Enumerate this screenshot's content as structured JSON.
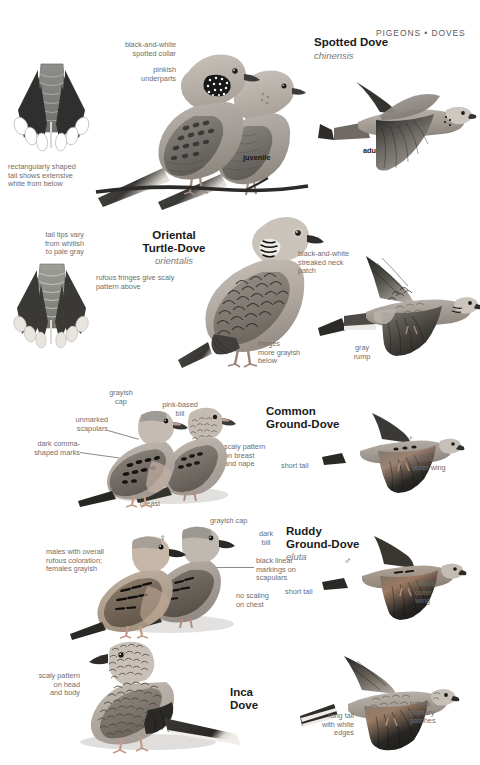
{
  "page": {
    "header": "PIGEONS • DOVES",
    "width": 480,
    "height": 765,
    "background": "#ffffff",
    "text_color": "#6e6e6e",
    "heading_color": "#1a1a1a"
  },
  "species": [
    {
      "id": "spotted-dove",
      "name": "Spotted Dove",
      "latin": "chinensis",
      "captions": [
        "black-and-white\nspotted collar",
        "pinkish\nunderparts",
        "rectangularly shaped\ntail shows extensive\nwhite from below"
      ],
      "labels": [
        "juvenile",
        "adult"
      ],
      "symbols": []
    },
    {
      "id": "oriental-turtle-dove",
      "name": "Oriental\nTurtle-Dove",
      "name_line1": "Oriental",
      "name_line2": "Turtle-Dove",
      "latin": "orientalis",
      "captions": [
        "tail tips vary\nfrom whitish\nto pale gray",
        "rufous fringes give scaly\npattern above",
        "black-and-white\nstreaked neck\npatch",
        "fringes\nmore grayish\nbelow",
        "gray\nrump"
      ],
      "labels": [],
      "symbols": []
    },
    {
      "id": "common-ground-dove",
      "name": "Common\nGround-Dove",
      "name_line1": "Common",
      "name_line2": "Ground-Dove",
      "latin": "",
      "captions": [
        "grayish\ncap",
        "pink-based\nbill",
        "unmarked\nscapulars",
        "dark comma-\nshaped marks",
        "scaly pattern\non breast\nand nape",
        "pinkish\nbreast",
        "short tail",
        "rufous\nouter wing"
      ],
      "labels": [],
      "symbols": [
        "♂",
        "♀",
        "♂"
      ]
    },
    {
      "id": "ruddy-ground-dove",
      "name": "Ruddy\nGround-Dove",
      "name_line1": "Ruddy",
      "name_line2": "Ground-Dove",
      "latin": "eluta",
      "captions": [
        "grayish cap",
        "dark\nbill",
        "males with overall\nrufous coloration;\nfemales grayish",
        "black linear\nmarkings on\nscapulars",
        "no scaling\non chest",
        "short tail",
        "rufous\nouter\nwing"
      ],
      "labels": [],
      "symbols": [
        "♀",
        "♂",
        "♂"
      ]
    },
    {
      "id": "inca-dove",
      "name": "Inca\nDove",
      "name_line1": "Inca",
      "name_line2": "Dove",
      "latin": "",
      "captions": [
        "scaly pattern\non head\nand body",
        "long tail\nwith white\nedges",
        "rufous\nprimary\npatches"
      ],
      "labels": [],
      "symbols": []
    }
  ],
  "colors": {
    "plate_gray": "#9a9a96",
    "plate_dark": "#3b3b3b",
    "plate_light": "#cfcbc4",
    "caption": "#6e6e6e",
    "leader": "#8b8b8b"
  }
}
